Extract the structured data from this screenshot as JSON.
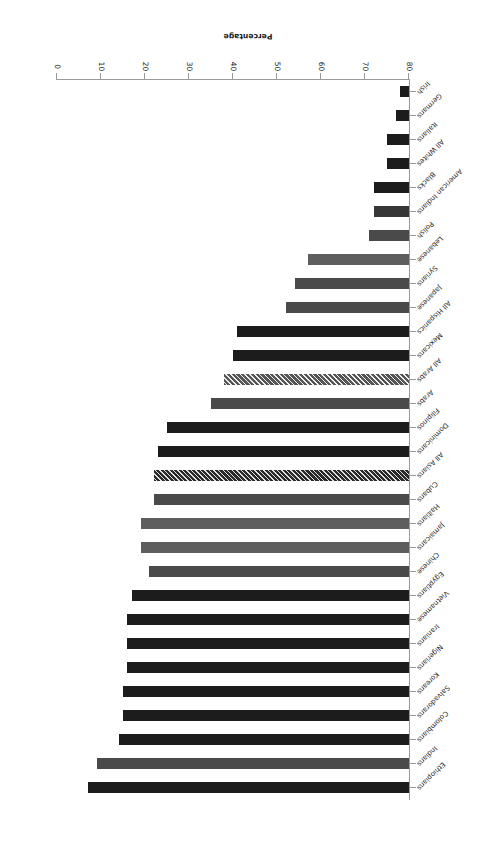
{
  "chart_data": {
    "type": "bar",
    "orientation": "horizontal",
    "title": "Percentage Foreign-Born by Group, 2006",
    "xlabel": "Percentage",
    "ylabel": "",
    "xlim": [
      0,
      80
    ],
    "xticks": [
      "0",
      "10",
      "20",
      "30",
      "40",
      "50",
      "60",
      "70",
      "80"
    ],
    "grid": false,
    "legend": "none",
    "categories": [
      "Ethiopians",
      "Indians",
      "Colombians",
      "Salvadorans",
      "Koreans",
      "Nigerians",
      "Iranians",
      "Vietnamese",
      "Egyptians",
      "Chinese",
      "Jamaicans",
      "Haitians",
      "Cubans",
      "All Asians",
      "Dominicans",
      "Filipinos",
      "Arabs",
      "All Arabs",
      "Mexicans",
      "All Hispanics",
      "Japanese",
      "Syrians",
      "Lebanese",
      "Polish",
      "American Indians",
      "Blacks",
      "All Whites",
      "Italians",
      "Germans",
      "Irish"
    ],
    "values": [
      73.0,
      71.0,
      66.0,
      65.0,
      65.0,
      64.0,
      64.0,
      64.0,
      63.0,
      59.0,
      61.0,
      61.0,
      58.0,
      58.0,
      57.0,
      55.0,
      45.0,
      42.0,
      40.0,
      39.0,
      28.0,
      26.0,
      23.0,
      9.0,
      8.0,
      8.0,
      5.0,
      5.0,
      3.0,
      2.0
    ],
    "series_name": "Percentage foreign-born"
  },
  "colors": {
    "bar_dark": "#1c1c1c",
    "bar_medium": "#4a4a4a",
    "bar_light": "#5e5e5e",
    "axis": "#9a9a9a",
    "text": "#1a1a1a",
    "background": "#ffffff"
  }
}
